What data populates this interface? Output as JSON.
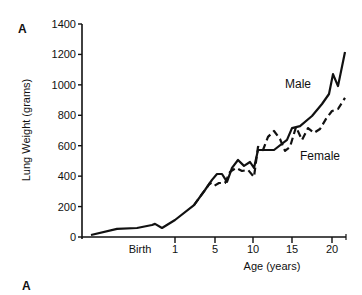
{
  "panel_label_top": "A",
  "panel_label_bottom": "A",
  "chart_data": {
    "type": "line",
    "title": "",
    "xlabel": "Age (years)",
    "ylabel": "Lung Weight (grams)",
    "ylim": [
      0,
      1400
    ],
    "yticks": [
      0,
      200,
      400,
      600,
      800,
      1000,
      1200,
      1400
    ],
    "xticks": [
      {
        "label": "Birth",
        "px": 140,
        "tick": false
      },
      {
        "label": "1",
        "px": 175,
        "tick": true
      },
      {
        "label": "5",
        "px": 215,
        "tick": true
      },
      {
        "label": "10",
        "px": 253,
        "tick": true
      },
      {
        "label": "15",
        "px": 292,
        "tick": true
      },
      {
        "label": "20",
        "px": 332,
        "tick": true
      }
    ],
    "grid": false,
    "legend": "inline labels",
    "series": [
      {
        "name": "Male",
        "style": "solid",
        "label_pos": [
          285,
          88
        ],
        "points_px_value": [
          [
            91,
            13
          ],
          [
            117,
            53
          ],
          [
            137,
            59
          ],
          [
            152,
            79
          ],
          [
            155,
            86
          ],
          [
            162,
            59
          ],
          [
            175,
            112
          ],
          [
            194,
            210
          ],
          [
            205,
            309
          ],
          [
            212,
            375
          ],
          [
            217,
            414
          ],
          [
            222,
            414
          ],
          [
            227,
            362
          ],
          [
            232,
            454
          ],
          [
            238,
            506
          ],
          [
            244,
            467
          ],
          [
            250,
            493
          ],
          [
            254,
            454
          ],
          [
            258,
            572
          ],
          [
            265,
            572
          ],
          [
            274,
            572
          ],
          [
            287,
            638
          ],
          [
            292,
            716
          ],
          [
            300,
            729
          ],
          [
            312,
            795
          ],
          [
            322,
            874
          ],
          [
            329,
            940
          ],
          [
            333,
            1071
          ],
          [
            338,
            992
          ],
          [
            345,
            1216
          ]
        ]
      },
      {
        "name": "Female",
        "style": "dashed",
        "label_pos": [
          300,
          160
        ],
        "points_px_value": [
          [
            194,
            210
          ],
          [
            205,
            309
          ],
          [
            210,
            355
          ],
          [
            214,
            335
          ],
          [
            219,
            355
          ],
          [
            225,
            355
          ],
          [
            230,
            428
          ],
          [
            236,
            454
          ],
          [
            242,
            434
          ],
          [
            248,
            441
          ],
          [
            254,
            395
          ],
          [
            258,
            592
          ],
          [
            263,
            572
          ],
          [
            268,
            658
          ],
          [
            274,
            697
          ],
          [
            280,
            644
          ],
          [
            285,
            566
          ],
          [
            290,
            592
          ],
          [
            296,
            723
          ],
          [
            302,
            638
          ],
          [
            308,
            716
          ],
          [
            314,
            684
          ],
          [
            320,
            710
          ],
          [
            326,
            776
          ],
          [
            332,
            828
          ],
          [
            338,
            841
          ],
          [
            345,
            914
          ]
        ]
      }
    ]
  }
}
